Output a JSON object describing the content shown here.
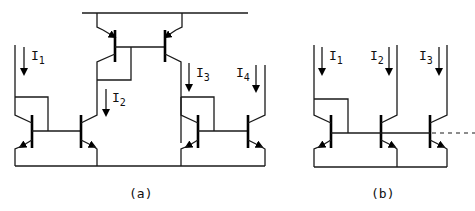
{
  "figure": {
    "subfigures": [
      {
        "caption": "(a)",
        "description": "Cascaded current mirrors: NPN mirror feeding PNP mirror feeding NPN mirror",
        "currents": [
          {
            "symbol": "I",
            "index": "1"
          },
          {
            "symbol": "I",
            "index": "2"
          },
          {
            "symbol": "I",
            "index": "3"
          },
          {
            "symbol": "I",
            "index": "4"
          }
        ]
      },
      {
        "caption": "(b)",
        "description": "Multiple-output NPN current mirror with shared base line continuing (dashed)",
        "currents": [
          {
            "symbol": "I",
            "index": "1"
          },
          {
            "symbol": "I",
            "index": "2"
          },
          {
            "symbol": "I",
            "index": "3"
          }
        ]
      }
    ],
    "colors": {
      "line": "#1a1a1a",
      "background": "#ffffff"
    }
  }
}
